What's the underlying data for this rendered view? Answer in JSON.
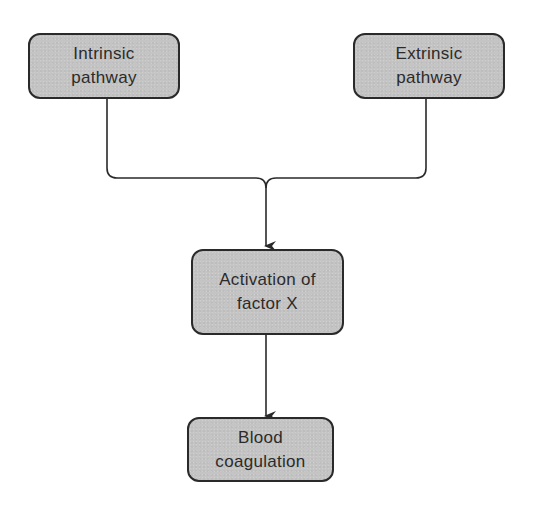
{
  "diagram": {
    "type": "flowchart",
    "nodes": [
      {
        "id": "intrinsic",
        "line1": "Intrinsic",
        "line2": "pathway"
      },
      {
        "id": "extrinsic",
        "line1": "Extrinsic",
        "line2": "pathway"
      },
      {
        "id": "activation",
        "line1": "Activation of",
        "line2": "factor X"
      },
      {
        "id": "coagulation",
        "line1": "Blood",
        "line2": "coagulation"
      }
    ],
    "edges": [
      {
        "from": "intrinsic",
        "to": "activation"
      },
      {
        "from": "extrinsic",
        "to": "activation"
      },
      {
        "from": "activation",
        "to": "coagulation"
      }
    ],
    "colors": {
      "node_fill": "#c4c4c4",
      "node_border": "#2a2a2a",
      "line": "#2a2a2a",
      "text": "#2b2b2b",
      "background": "#ffffff"
    }
  }
}
